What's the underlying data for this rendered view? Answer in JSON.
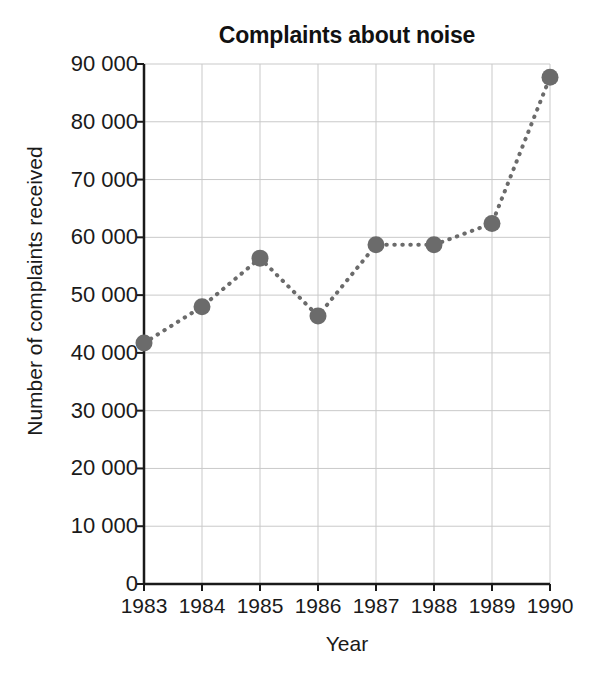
{
  "chart_data": {
    "type": "line",
    "title": "Complaints about noise",
    "xlabel": "Year",
    "ylabel": "Number of complaints received",
    "categories": [
      "1983",
      "1984",
      "1985",
      "1986",
      "1987",
      "1988",
      "1989",
      "1990"
    ],
    "x": [
      1983,
      1984,
      1985,
      1986,
      1987,
      1988,
      1989,
      1990
    ],
    "values": [
      41700,
      48000,
      56400,
      46400,
      58700,
      58700,
      62400,
      87700
    ],
    "series": [
      {
        "name": "Number of complaints received",
        "values": [
          41700,
          48000,
          56400,
          46400,
          58700,
          58700,
          62400,
          87700
        ]
      }
    ],
    "ylim": [
      0,
      90000
    ],
    "xlim": [
      1983,
      1990
    ],
    "y_ticks": [
      0,
      10000,
      20000,
      30000,
      40000,
      50000,
      60000,
      70000,
      80000,
      90000
    ],
    "y_tick_labels": [
      "0",
      "10 000",
      "20 000",
      "30 000",
      "40 000",
      "50 000",
      "60 000",
      "70 000",
      "80 000",
      "90 000"
    ],
    "x_ticks": [
      1983,
      1984,
      1985,
      1986,
      1987,
      1988,
      1989,
      1990
    ],
    "x_tick_labels": [
      "1983",
      "1984",
      "1985",
      "1986",
      "1987",
      "1988",
      "1989",
      "1990"
    ],
    "grid": true,
    "legend": false,
    "line_style": "dotted",
    "marker": "circle",
    "marker_color": "#6b6b6b",
    "line_color": "#6b6b6b",
    "grid_color": "#c9c9c9",
    "axis_color": "#1a1a1a",
    "background": "#ffffff"
  }
}
